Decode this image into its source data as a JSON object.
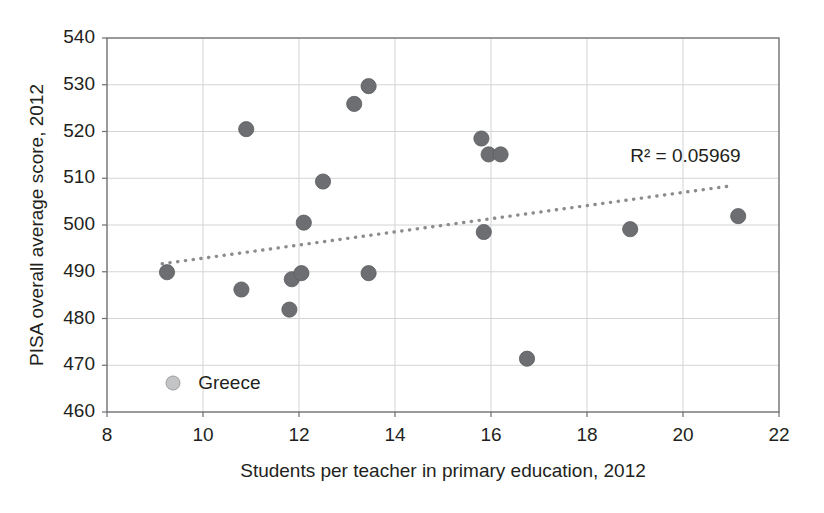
{
  "chart_data": {
    "type": "scatter",
    "title": "",
    "xlabel": "Students per teacher in primary education, 2012",
    "ylabel": "PISA overall average score, 2012",
    "xlim": [
      8,
      22
    ],
    "ylim": [
      460,
      540
    ],
    "xticks": [
      8,
      10,
      12,
      14,
      16,
      18,
      20,
      22
    ],
    "yticks": [
      460,
      470,
      480,
      490,
      500,
      510,
      520,
      530,
      540
    ],
    "grid": true,
    "legend": {
      "position": "inside-bottom-left",
      "entries": [
        "Greece"
      ]
    },
    "annotations": [
      {
        "text": "R² = 0.05969",
        "x": 20.05,
        "y": 514.5
      }
    ],
    "series": [
      {
        "name": "Greece",
        "marker": "circle",
        "color": "#6d6e71",
        "points": [
          {
            "x": 9.25,
            "y": 489.9
          },
          {
            "x": 10.8,
            "y": 486.2
          },
          {
            "x": 10.9,
            "y": 520.5
          },
          {
            "x": 11.8,
            "y": 481.9
          },
          {
            "x": 11.85,
            "y": 488.4
          },
          {
            "x": 12.05,
            "y": 489.7
          },
          {
            "x": 12.1,
            "y": 500.5
          },
          {
            "x": 12.5,
            "y": 509.3
          },
          {
            "x": 13.15,
            "y": 525.9
          },
          {
            "x": 13.45,
            "y": 529.7
          },
          {
            "x": 13.45,
            "y": 489.7
          },
          {
            "x": 15.8,
            "y": 518.5
          },
          {
            "x": 15.85,
            "y": 498.5
          },
          {
            "x": 15.95,
            "y": 515.1
          },
          {
            "x": 16.2,
            "y": 515.1
          },
          {
            "x": 16.75,
            "y": 471.4
          },
          {
            "x": 18.9,
            "y": 499.1
          },
          {
            "x": 21.15,
            "y": 501.9
          }
        ]
      }
    ],
    "trendline": {
      "style": "dotted",
      "color": "#8b8c8e",
      "x_start": 9.15,
      "y_start": 491.7,
      "x_end": 20.95,
      "y_end": 508.3,
      "r_squared": "0.05969"
    }
  }
}
